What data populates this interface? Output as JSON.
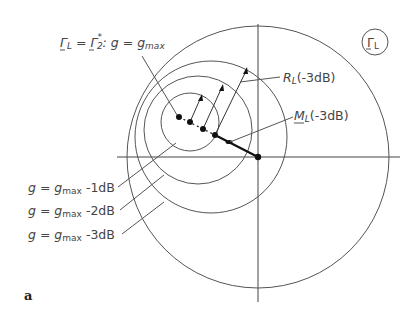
{
  "figure": {
    "panel_label": "a",
    "badge": {
      "symbol": "Γ",
      "subscript": "L"
    },
    "labels": {
      "optimum": {
        "lhs": "Γ",
        "lhs_sub": "L",
        "eq": " = ",
        "rhs": "Γ",
        "rhs_sub": "2",
        "rhs_sup": "*",
        "cond": ": g = g",
        "cond_sub": "max"
      },
      "radius": {
        "main": "R",
        "sub": "L",
        "tail": "(-3dB)"
      },
      "center": {
        "main": "M",
        "sub": "L",
        "tail": "(-3dB)"
      },
      "contours": [
        {
          "pre": "g = g",
          "sub": "max",
          "tail": " -1dB"
        },
        {
          "pre": "g = g",
          "sub": "max",
          "tail": " -2dB"
        },
        {
          "pre": "g = g",
          "sub": "max",
          "tail": " -3dB"
        }
      ]
    },
    "geometry": {
      "origin": [
        258,
        157
      ],
      "unit_circle_radius": 131,
      "gain_circles": [
        {
          "name": "-1dB",
          "cx": 190,
          "cy": 122,
          "r": 29
        },
        {
          "name": "-2dB",
          "cx": 198,
          "cy": 130,
          "r": 54
        },
        {
          "name": "-3dB",
          "cx": 211,
          "cy": 137,
          "r": 76
        }
      ],
      "points": [
        [
          179,
          117
        ],
        [
          190,
          122
        ],
        [
          203,
          129
        ],
        [
          215,
          135
        ],
        [
          229,
          142
        ],
        [
          258,
          157
        ]
      ]
    }
  }
}
